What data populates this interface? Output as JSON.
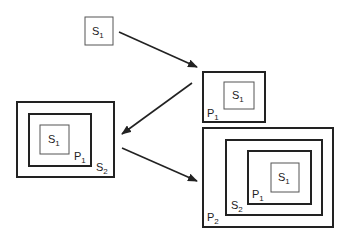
{
  "diagram": {
    "colors": {
      "stroke": "#222222",
      "thin": "#555555",
      "background": "#ffffff"
    },
    "stage1": {
      "boxes": [
        {
          "label": "S",
          "sub": "1"
        }
      ]
    },
    "stage2": {
      "boxes": [
        {
          "label": "S",
          "sub": "1"
        },
        {
          "label": "P",
          "sub": "1"
        }
      ]
    },
    "stage3": {
      "boxes": [
        {
          "label": "S",
          "sub": "1"
        },
        {
          "label": "P",
          "sub": "1"
        },
        {
          "label": "S",
          "sub": "2"
        }
      ]
    },
    "stage4": {
      "boxes": [
        {
          "label": "S",
          "sub": "1"
        },
        {
          "label": "P",
          "sub": "1"
        },
        {
          "label": "S",
          "sub": "2"
        },
        {
          "label": "P",
          "sub": "2"
        }
      ]
    },
    "arrows": [
      {
        "from": "stage1",
        "to": "stage2"
      },
      {
        "from": "stage2",
        "to": "stage3"
      },
      {
        "from": "stage3",
        "to": "stage4"
      }
    ]
  }
}
